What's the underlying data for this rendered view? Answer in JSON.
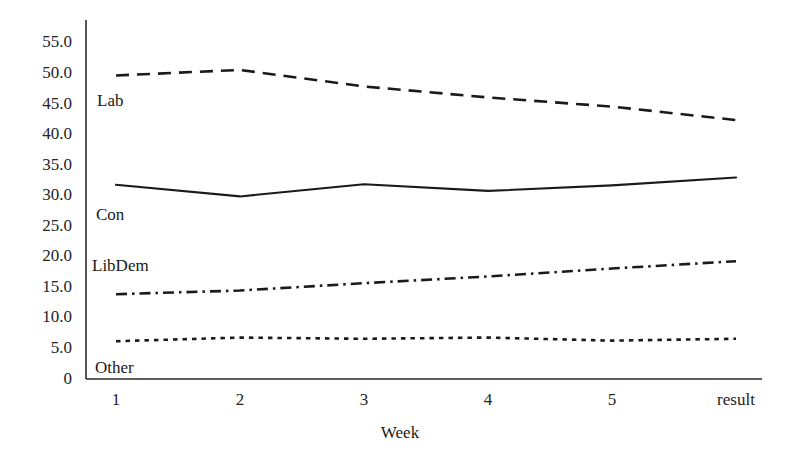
{
  "chart_data": {
    "type": "line",
    "title": "",
    "subtitle": "",
    "xlabel": "Week",
    "ylabel": "",
    "categories": [
      "1",
      "2",
      "3",
      "4",
      "5",
      "result"
    ],
    "x_tick_labels": [
      "1",
      "2",
      "3",
      "4",
      "5",
      "result"
    ],
    "y_tick_labels": [
      "55.0",
      "50.0",
      "45.0",
      "40.0",
      "35.0",
      "30.0",
      "25.0",
      "20.0",
      "15.0",
      "10.0",
      "5.0",
      "0"
    ],
    "y_tick_values": [
      55.0,
      50.0,
      45.0,
      40.0,
      35.0,
      30.0,
      25.0,
      20.0,
      15.0,
      10.0,
      5.0,
      0
    ],
    "ylim": [
      0,
      57
    ],
    "xlim": [
      0,
      5
    ],
    "grid": false,
    "legend": "inline-labels",
    "legend_position": "inline-left",
    "series": [
      {
        "name": "Lab",
        "style": "dashed",
        "color": "#1a1a1a",
        "values": [
          49.6,
          50.5,
          47.8,
          46.0,
          44.5,
          42.3
        ]
      },
      {
        "name": "Con",
        "style": "solid",
        "color": "#1a1a1a",
        "values": [
          31.7,
          29.8,
          31.8,
          30.7,
          31.6,
          32.9
        ]
      },
      {
        "name": "LibDem",
        "style": "dashdot",
        "color": "#1a1a1a",
        "values": [
          13.8,
          14.4,
          15.6,
          16.7,
          18.0,
          19.2
        ]
      },
      {
        "name": "Other",
        "style": "dotted",
        "color": "#1a1a1a",
        "values": [
          6.1,
          6.7,
          6.5,
          6.7,
          6.2,
          6.5
        ]
      }
    ],
    "annotations": []
  },
  "axes": {
    "axis_color": "#2b2b2b"
  }
}
